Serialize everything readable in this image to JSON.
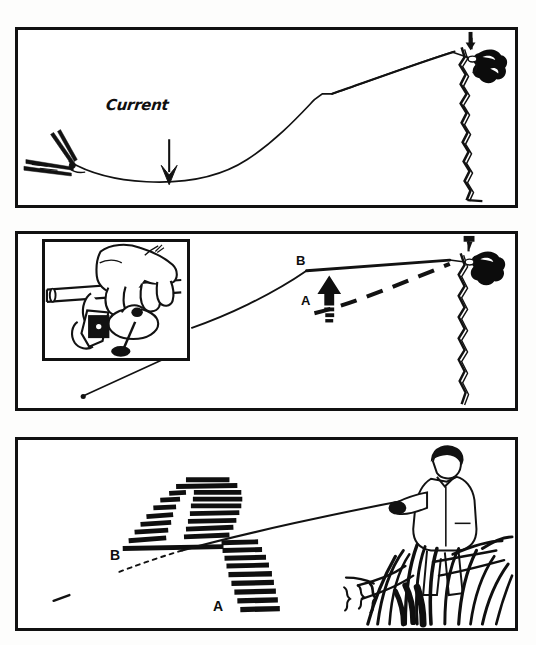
{
  "document": {
    "type": "instructional-illustration",
    "subject": "fishing-line-mending-sequence",
    "background_color": "#ffffff",
    "ink_color": "#111111",
    "panel_count": 3
  },
  "panels": [
    {
      "id": "panel-1",
      "name": "line-bow-in-current",
      "labels": {
        "current": "Current"
      },
      "elements": {
        "rod_tip": "rod-tip-left",
        "snag": "dark-snag-blob-right",
        "reed": "vertical-reed-line",
        "line_state": "bowed-downstream",
        "arrow_direction": "down"
      }
    },
    {
      "id": "panel-2",
      "name": "mend-lift-rod",
      "labels": {
        "a": "A",
        "b": "B"
      },
      "inset": {
        "name": "hand-on-reel-detail",
        "contents": "hand-gripping-spinning-reel-on-rod"
      },
      "elements": {
        "line_before": "dashed-line-A",
        "line_after": "solid-line-B",
        "arrow_direction": "up",
        "snag": "dark-snag-blob-right",
        "reed": "vertical-reed-line",
        "pointer": "leader-line-to-inset"
      }
    },
    {
      "id": "panel-3",
      "name": "angler-flipping-loop",
      "labels": {
        "a": "A",
        "b": "B"
      },
      "elements": {
        "angler": "standing-angler-with-rod",
        "vegetation": "reed-grass-bank",
        "loop_arc": "dashed-arc-line-flip",
        "line_before": "dotted-line-B",
        "line_after": "solid-line-A",
        "dash_count": 24
      }
    }
  ]
}
